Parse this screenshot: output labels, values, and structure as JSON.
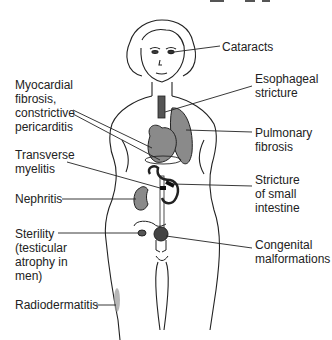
{
  "diagram": {
    "labels": [
      {
        "id": "cataracts",
        "text": "Cataracts",
        "x": 222,
        "y": 40
      },
      {
        "id": "myocardial",
        "text": "Myocardial\nfibrosis,\nconstrictive\npericarditis",
        "x": 15,
        "y": 78
      },
      {
        "id": "esophageal",
        "text": "Esophageal\nstricture",
        "x": 255,
        "y": 72
      },
      {
        "id": "pulmonary",
        "text": "Pulmonary\nfibrosis",
        "x": 255,
        "y": 128
      },
      {
        "id": "transverse",
        "text": "Transverse\nmyelitis",
        "x": 15,
        "y": 148
      },
      {
        "id": "nephritis",
        "text": "Nephritis",
        "x": 15,
        "y": 192
      },
      {
        "id": "stricture_small",
        "text": "Stricture\nof small\nintestine",
        "x": 255,
        "y": 173
      },
      {
        "id": "sterility",
        "text": "Sterility\n(testicular\natrophy in\nmen)",
        "x": 15,
        "y": 228
      },
      {
        "id": "congenital",
        "text": "Congenital\nmalformations",
        "x": 255,
        "y": 238
      },
      {
        "id": "radiodermatitis",
        "text": "Radiodermatitis",
        "x": 15,
        "y": 298
      }
    ],
    "colors": {
      "organ_fill": "#8a8a8a",
      "outline": "#222222",
      "background": "#ffffff"
    }
  }
}
